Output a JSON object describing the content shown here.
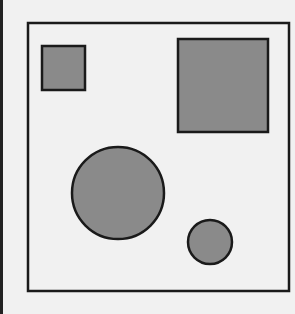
{
  "figure": {
    "background": "#f1f1f1",
    "stroke": "#1a1a1a",
    "fill": "#8a8a8a",
    "frame": {
      "x": 27,
      "y": 22,
      "width": 263,
      "height": 270
    },
    "shapes": [
      {
        "type": "square",
        "name": "small-square",
        "x": 41,
        "y": 45,
        "width": 45,
        "height": 46
      },
      {
        "type": "square",
        "name": "large-square",
        "x": 177,
        "y": 38,
        "width": 92,
        "height": 95
      },
      {
        "type": "circle",
        "name": "large-circle",
        "cx": 118,
        "cy": 193,
        "r": 46
      },
      {
        "type": "circle",
        "name": "small-circle",
        "cx": 210,
        "cy": 242,
        "r": 22
      }
    ]
  }
}
